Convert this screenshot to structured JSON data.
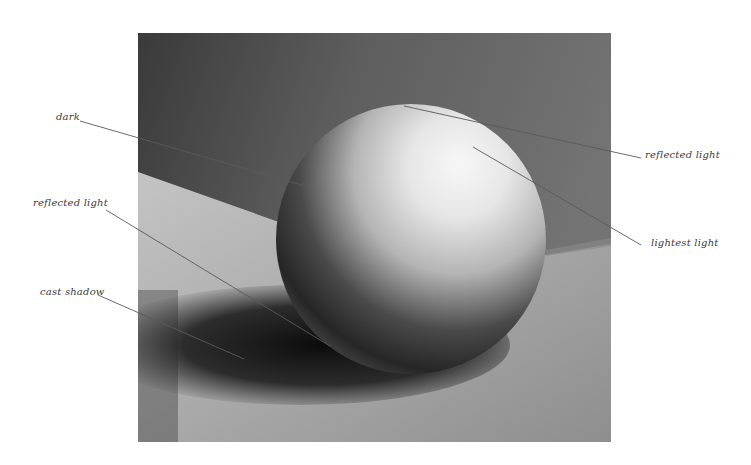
{
  "figure": {
    "colors": {
      "background": "#ffffff",
      "wall": "#6f6f6f",
      "wall_dark": "#3d3d3d",
      "floor_light": "#b9b9b9",
      "floor_mid": "#9a9a9a",
      "shadow": "#141414",
      "sphere_light": "#f2f2f2",
      "sphere_dark": "#232323",
      "leader_line": "#5a5a5a",
      "label_text": "#3a3a3a"
    },
    "annotations": [
      {
        "id": "dark",
        "text": "dark"
      },
      {
        "id": "reflected-light-left",
        "text": "reflected light"
      },
      {
        "id": "cast-shadow",
        "text": "cast shadow"
      },
      {
        "id": "reflected-light-right",
        "text": "reflected light"
      },
      {
        "id": "lightest-light",
        "text": "lightest light"
      }
    ]
  }
}
